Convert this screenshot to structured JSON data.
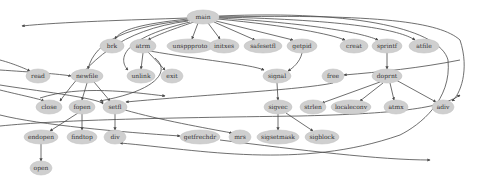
{
  "diagram": {
    "type": "call-graph",
    "colors": {
      "node_fill": "#cfcfcf",
      "edge": "#4a4a4a",
      "label": "#333333",
      "background": "#ffffff"
    },
    "nodes": [
      {
        "id": "main",
        "label": "main",
        "x": 203,
        "y": 17,
        "rx": 16,
        "ry": 7
      },
      {
        "id": "brk",
        "label": "brk",
        "x": 112,
        "y": 46,
        "rx": 12,
        "ry": 7
      },
      {
        "id": "atrm",
        "label": "atrm",
        "x": 143,
        "y": 46,
        "rx": 13,
        "ry": 7
      },
      {
        "id": "unsppproto",
        "label": "unsppproto",
        "x": 190,
        "y": 46,
        "rx": 23,
        "ry": 7
      },
      {
        "id": "initxes",
        "label": "initxes",
        "x": 224,
        "y": 46,
        "rx": 15,
        "ry": 7
      },
      {
        "id": "safesetfl",
        "label": "safesetfl",
        "x": 263,
        "y": 46,
        "rx": 19,
        "ry": 7
      },
      {
        "id": "getpid",
        "label": "getpid",
        "x": 302,
        "y": 46,
        "rx": 15,
        "ry": 7
      },
      {
        "id": "creat",
        "label": "creat",
        "x": 354,
        "y": 46,
        "rx": 14,
        "ry": 7
      },
      {
        "id": "sprintf",
        "label": "sprintf",
        "x": 387,
        "y": 46,
        "rx": 15,
        "ry": 7
      },
      {
        "id": "atfile",
        "label": "atfile",
        "x": 424,
        "y": 46,
        "rx": 15,
        "ry": 7
      },
      {
        "id": "read",
        "label": "read",
        "x": 38,
        "y": 76,
        "rx": 12,
        "ry": 7
      },
      {
        "id": "newfile",
        "label": "newfile",
        "x": 87,
        "y": 76,
        "rx": 16,
        "ry": 7
      },
      {
        "id": "unlink",
        "label": "unlink",
        "x": 141,
        "y": 76,
        "rx": 14,
        "ry": 7
      },
      {
        "id": "exit",
        "label": "exit",
        "x": 172,
        "y": 76,
        "rx": 11,
        "ry": 7
      },
      {
        "id": "signal",
        "label": "signal",
        "x": 277,
        "y": 76,
        "rx": 14,
        "ry": 7
      },
      {
        "id": "free",
        "label": "free",
        "x": 333,
        "y": 76,
        "rx": 11,
        "ry": 7
      },
      {
        "id": "doprnt",
        "label": "doprnt",
        "x": 387,
        "y": 76,
        "rx": 15,
        "ry": 7
      },
      {
        "id": "close",
        "label": "close",
        "x": 49,
        "y": 107,
        "rx": 13,
        "ry": 7
      },
      {
        "id": "fopen",
        "label": "fopen",
        "x": 82,
        "y": 107,
        "rx": 13,
        "ry": 7
      },
      {
        "id": "setfl",
        "label": "setfl",
        "x": 115,
        "y": 107,
        "rx": 12,
        "ry": 7
      },
      {
        "id": "sigvec",
        "label": "sigvec",
        "x": 278,
        "y": 107,
        "rx": 14,
        "ry": 7
      },
      {
        "id": "strlen",
        "label": "strlen",
        "x": 313,
        "y": 107,
        "rx": 13,
        "ry": 7
      },
      {
        "id": "localeconv",
        "label": "localeconv",
        "x": 351,
        "y": 107,
        "rx": 20,
        "ry": 7
      },
      {
        "id": "atmx",
        "label": "atmx",
        "x": 396,
        "y": 107,
        "rx": 12,
        "ry": 7
      },
      {
        "id": "adiv",
        "label": "adiv",
        "x": 443,
        "y": 107,
        "rx": 11,
        "ry": 7
      },
      {
        "id": "endopen",
        "label": "endopen",
        "x": 41,
        "y": 137,
        "rx": 17,
        "ry": 7
      },
      {
        "id": "findtop",
        "label": "findtop",
        "x": 82,
        "y": 137,
        "rx": 15,
        "ry": 7
      },
      {
        "id": "div",
        "label": "div",
        "x": 115,
        "y": 137,
        "rx": 11,
        "ry": 7
      },
      {
        "id": "getfrechdr",
        "label": "getfrechdr",
        "x": 200,
        "y": 137,
        "rx": 20,
        "ry": 7
      },
      {
        "id": "mrs",
        "label": "mrs",
        "x": 240,
        "y": 137,
        "rx": 11,
        "ry": 7
      },
      {
        "id": "sigsetmask",
        "label": "sigsetmask",
        "x": 278,
        "y": 137,
        "rx": 21,
        "ry": 7
      },
      {
        "id": "sigblock",
        "label": "sigblock",
        "x": 322,
        "y": 137,
        "rx": 17,
        "ry": 7
      },
      {
        "id": "open",
        "label": "open",
        "x": 41,
        "y": 168,
        "rx": 11,
        "ry": 7
      }
    ],
    "edges": [
      {
        "d": "M188,18 C130,20 60,22 22,26"
      },
      {
        "d": "M188,19 C140,24 120,30 115,39"
      },
      {
        "d": "M194,22 C170,30 155,36 148,40"
      },
      {
        "d": "M198,23 L192,39"
      },
      {
        "d": "M208,23 L220,39"
      },
      {
        "d": "M214,22 L255,40"
      },
      {
        "d": "M216,21 L293,40"
      },
      {
        "d": "M218,19 C290,26 330,34 345,40"
      },
      {
        "d": "M219,18 C320,24 365,34 378,40"
      },
      {
        "d": "M219,17 C350,20 400,30 415,40"
      },
      {
        "d": "M219,17 C380,14 440,22 460,40 C470,70 460,95 452,101"
      },
      {
        "d": "M219,16 C360,10 440,30 448,60 C452,100 420,125 400,135 C300,170 200,150 120,143"
      },
      {
        "d": "M190,20 C130,26 95,40 88,69"
      },
      {
        "d": "M188,21 C120,30 90,60 60,101"
      },
      {
        "d": "M190,22 C115,40 120,62 128,70"
      },
      {
        "d": "M143,53 L141,69"
      },
      {
        "d": "M148,52 L165,70"
      },
      {
        "d": "M150,51 C200,60 250,64 264,70"
      },
      {
        "d": "M302,53 C300,62 293,68 288,71"
      },
      {
        "d": "M387,53 L387,69"
      },
      {
        "d": "M460,60 C420,68 380,72 344,75"
      },
      {
        "d": "M0,60 C15,64 28,70 30,71"
      },
      {
        "d": "M0,70 C30,72 60,74 71,76"
      },
      {
        "d": "M87,83 C85,90 83,96 82,100"
      },
      {
        "d": "M94,82 L110,101"
      },
      {
        "d": "M0,85 C30,90 100,98 103,104"
      },
      {
        "d": "M0,90 C20,95 40,99 44,101"
      },
      {
        "d": "M82,114 L82,130"
      },
      {
        "d": "M78,113 L50,131"
      },
      {
        "d": "M115,114 L115,130"
      },
      {
        "d": "M125,110 C160,120 205,128 232,133"
      },
      {
        "d": "M0,115 C40,125 120,132 180,136"
      },
      {
        "d": "M0,126 C60,120 150,118 300,116 C380,114 440,110 460,95"
      },
      {
        "d": "M333,83 C300,90 200,95 126,102"
      },
      {
        "d": "M277,83 L278,100"
      },
      {
        "d": "M278,114 L278,130"
      },
      {
        "d": "M286,113 L313,131"
      },
      {
        "d": "M380,82 L322,103"
      },
      {
        "d": "M383,83 L360,101"
      },
      {
        "d": "M390,83 L394,100"
      },
      {
        "d": "M396,80 L436,102"
      },
      {
        "d": "M41,144 L41,161"
      },
      {
        "d": "M220,140 C300,150 380,160 430,160"
      },
      {
        "d": "M40,98 C80,85 130,92 165,96"
      },
      {
        "d": "M155,58 C170,70 160,90 100,101"
      }
    ]
  }
}
